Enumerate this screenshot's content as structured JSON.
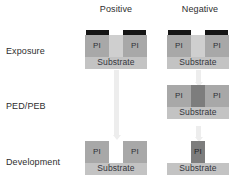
{
  "diagram": {
    "columns": [
      {
        "id": "positive",
        "label": "Positive"
      },
      {
        "id": "negative",
        "label": "Negative"
      }
    ],
    "rows": [
      {
        "id": "exposure",
        "label": "Exposure"
      },
      {
        "id": "ped-peb",
        "label": "PED/PEB"
      },
      {
        "id": "development",
        "label": "Development"
      }
    ],
    "labels": {
      "pi": "PI",
      "substrate": "Substrate"
    },
    "colors": {
      "resist": "#a8a8a8",
      "resist_crosslinked": "#7d7d7d",
      "exposed_gap": "#cfcfcf",
      "substrate": "#c3c3c3",
      "mask": "#151515",
      "arrow": "#ededed",
      "text": "#2e2e2e",
      "background": "#ffffff"
    },
    "cells": {
      "positive_exposure": {
        "has_mask": true,
        "blocks": [
          {
            "kind": "resist",
            "label": "PI"
          },
          {
            "kind": "gap",
            "label": ""
          },
          {
            "kind": "resist",
            "label": "PI"
          }
        ],
        "substrate": "Substrate"
      },
      "negative_exposure": {
        "has_mask": true,
        "blocks": [
          {
            "kind": "resist",
            "label": "PI"
          },
          {
            "kind": "gap",
            "label": ""
          },
          {
            "kind": "resist",
            "label": "PI"
          }
        ],
        "substrate": "Substrate"
      },
      "positive_pedpeb": {
        "present": false
      },
      "negative_pedpeb": {
        "has_mask": false,
        "blocks": [
          {
            "kind": "resist",
            "label": "PI"
          },
          {
            "kind": "crosslinked",
            "label": ""
          },
          {
            "kind": "resist",
            "label": "PI"
          }
        ],
        "substrate": "Substrate"
      },
      "positive_development": {
        "has_mask": false,
        "blocks": [
          {
            "kind": "resist",
            "label": "PI"
          },
          {
            "kind": "empty",
            "label": ""
          },
          {
            "kind": "resist",
            "label": "PI"
          }
        ],
        "substrate": "Substrate"
      },
      "negative_development": {
        "has_mask": false,
        "blocks": [
          {
            "kind": "empty",
            "label": ""
          },
          {
            "kind": "crosslinked",
            "label": "PI"
          },
          {
            "kind": "empty",
            "label": ""
          }
        ],
        "substrate": "Substrate"
      }
    },
    "arrows": [
      {
        "id": "positive-exposure-to-development",
        "column": "positive"
      },
      {
        "id": "negative-exposure-to-pedpeb",
        "column": "negative"
      },
      {
        "id": "negative-pedpeb-to-development",
        "column": "negative"
      }
    ]
  }
}
